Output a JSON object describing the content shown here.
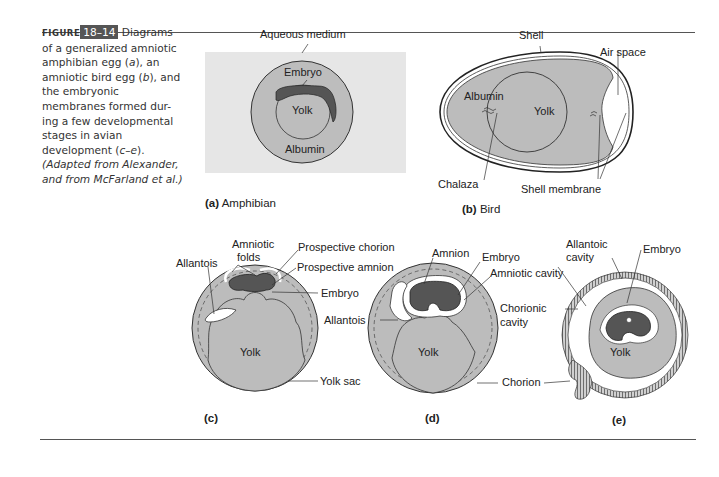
{
  "caption": {
    "figure_word": "FIGURE",
    "figure_number": "18–14",
    "text_lines": [
      "Diagrams",
      "of a generalized amniotic",
      "amphibian egg (a), an",
      "amniotic bird egg (b), and",
      "the embryonic",
      "membranes formed dur-",
      "ing a few developmental",
      "stages in avian",
      "development (c–e).",
      "(Adapted from Alexander,",
      "and from McFarland et al.)"
    ],
    "l1": "Diagrams",
    "l2": "of a generalized amniotic",
    "l3a": "amphibian egg (",
    "l3i": "a",
    "l3b": "), an",
    "l4a": "amniotic bird egg (",
    "l4i": "b",
    "l4b": "), and",
    "l5": "the embryonic",
    "l6": "membranes formed dur-",
    "l7": "ing a few developmental",
    "l8": "stages in avian",
    "l9a": "development (",
    "l9i": "c–e",
    "l9b": ").",
    "l10": "(Adapted from Alexander,",
    "l11": "and from McFarland et al.)"
  },
  "panels": {
    "a": {
      "tag": "(a)",
      "name": "Amphibian",
      "labels": {
        "aqueous": "Aqueous medium",
        "embryo": "Embryo",
        "yolk": "Yolk",
        "albumin": "Albumin"
      }
    },
    "b": {
      "tag": "(b)",
      "name": "Bird",
      "labels": {
        "shell": "Shell",
        "air_space": "Air space",
        "albumin": "Albumin",
        "yolk": "Yolk",
        "chalaza": "Chalaza",
        "shell_membrane": "Shell membrane"
      }
    },
    "c": {
      "tag": "(c)",
      "labels": {
        "amniotic_folds_1": "Amniotic",
        "amniotic_folds_2": "folds",
        "prospective_chorion": "Prospective chorion",
        "allantois": "Allantois",
        "prospective_amnion": "Prospective amnion",
        "embryo": "Embryo",
        "yolk": "Yolk",
        "yolk_sac": "Yolk sac"
      }
    },
    "d": {
      "tag": "(d)",
      "labels": {
        "amnion": "Amnion",
        "embryo": "Embryo",
        "amniotic_cavity": "Amniotic cavity",
        "allantois": "Allantois",
        "yolk": "Yolk",
        "chorion": "Chorion"
      }
    },
    "e": {
      "tag": "(e)",
      "labels": {
        "allantoic_cavity_1": "Allantoic",
        "allantoic_cavity_2": "cavity",
        "embryo": "Embryo",
        "chorionic_cavity_1": "Chorionic",
        "chorionic_cavity_2": "cavity",
        "yolk": "Yolk"
      }
    }
  },
  "colors": {
    "medium_gray": "#b8b8b8",
    "panel_bg": "#e6e6e6",
    "embryo_dark": "#555555",
    "caption_box": "#555555"
  }
}
